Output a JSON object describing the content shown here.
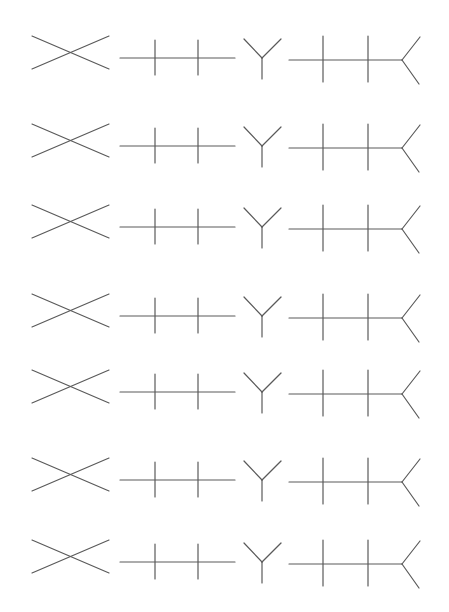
{
  "figure": {
    "line_color": "#5a5a5a",
    "background": "#ffffff",
    "row_count": 7,
    "row_offsets_y": [
      0,
      88,
      169,
      258,
      334,
      422,
      504
    ]
  },
  "shapes": [
    {
      "name": "x-figure",
      "lines": [
        [
          32,
          36,
          109,
          69
        ],
        [
          32,
          69,
          109,
          36
        ]
      ]
    },
    {
      "name": "ticked-line",
      "lines": [
        [
          120,
          58,
          235,
          58
        ],
        [
          155,
          40,
          155,
          75
        ],
        [
          198,
          40,
          198,
          75
        ]
      ]
    },
    {
      "name": "y-figure",
      "lines": [
        [
          244,
          39,
          262,
          58
        ],
        [
          281,
          39,
          262,
          58
        ],
        [
          262,
          58,
          262,
          79
        ]
      ]
    },
    {
      "name": "forked-ticked-line",
      "lines": [
        [
          289,
          60,
          402,
          60
        ],
        [
          323,
          36,
          323,
          82
        ],
        [
          368,
          36,
          368,
          82
        ],
        [
          402,
          60,
          420,
          37
        ],
        [
          402,
          60,
          419,
          84
        ]
      ]
    }
  ]
}
